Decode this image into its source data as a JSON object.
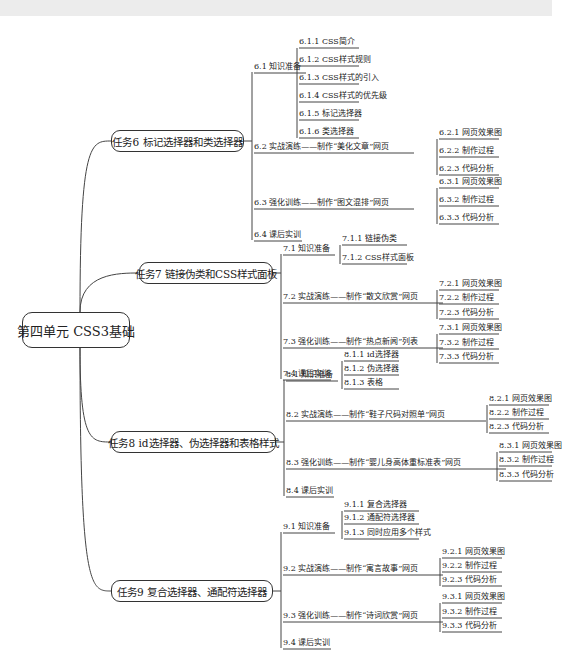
{
  "root": "第四单元 CSS3基础",
  "tasks": [
    {
      "title": "任务6  标记选择器和类选择器",
      "sections": [
        {
          "label": "6.1  知识准备",
          "children": [
            "6.1.1  CSS简介",
            "6.1.2  CSS样式规则",
            "6.1.3  CSS样式的引入",
            "6.1.4  CSS样式的优先级",
            "6.1.5  标记选择器",
            "6.1.6  类选择器"
          ]
        },
        {
          "label": "6.2  实战演练——制作“美化文章”网页",
          "children": [
            "6.2.1  网页效果图",
            "6.2.2  制作过程",
            "6.2.3  代码分析"
          ]
        },
        {
          "label": "6.3  强化训练——制作“图文混排”网页",
          "children": [
            "6.3.1  网页效果图",
            "6.3.2  制作过程",
            "6.3.3  代码分析"
          ]
        },
        {
          "label": "6.4  课后实训",
          "children": []
        }
      ]
    },
    {
      "title": "任务7  链接伪类和CSS样式面板",
      "sections": [
        {
          "label": "7.1  知识准备",
          "children": [
            "7.1.1  链接伪类",
            "7.1.2  CSS样式面板"
          ]
        },
        {
          "label": "7.2  实战演练——制作“散文欣赏”网页",
          "children": [
            "7.2.1  网页效果图",
            "7.2.2  制作过程",
            "7.2.3  代码分析"
          ]
        },
        {
          "label": "7.3  强化训练——制作“热点新闻”列表",
          "children": [
            "7.3.1  网页效果图",
            "7.3.2  制作过程",
            "7.3.3  代码分析"
          ]
        },
        {
          "label": "7.4  课后实训",
          "children": []
        }
      ]
    },
    {
      "title": "任务8  id选择器、伪选择器和表格样式",
      "sections": [
        {
          "label": "8.1  知识准备",
          "children": [
            "8.1.1  id选择器",
            "8.1.2  伪选择器",
            "8.1.3  表格"
          ]
        },
        {
          "label": "8.2  实战演练——制作“鞋子尺码对照单”网页",
          "children": [
            "8.2.1  网页效果图",
            "8.2.2  制作过程",
            "8.2.3  代码分析"
          ]
        },
        {
          "label": "8.3  强化训练——制作“婴儿身高体重标准表”网页",
          "children": [
            "8.3.1  网页效果图",
            "8.3.2  制作过程",
            "8.3.3  代码分析"
          ]
        },
        {
          "label": "8.4  课后实训",
          "children": []
        }
      ]
    },
    {
      "title": "任务9  复合选择器、通配符选择器",
      "sections": [
        {
          "label": "9.1  知识准备",
          "children": [
            "9.1.1  复合选择器",
            "9.1.2  通配符选择器",
            "9.1.3  同时应用多个样式"
          ]
        },
        {
          "label": "9.2  实战演练——制作“寓言故事”网页",
          "children": [
            "9.2.1  网页效果图",
            "9.2.2  制作过程",
            "9.2.3  代码分析"
          ]
        },
        {
          "label": "9.3  强化训练——制作“诗词欣赏”网页",
          "children": [
            "9.3.1  网页效果图",
            "9.3.2  制作过程",
            "9.3.3  代码分析"
          ]
        },
        {
          "label": "9.4  课后实训",
          "children": []
        }
      ]
    }
  ]
}
